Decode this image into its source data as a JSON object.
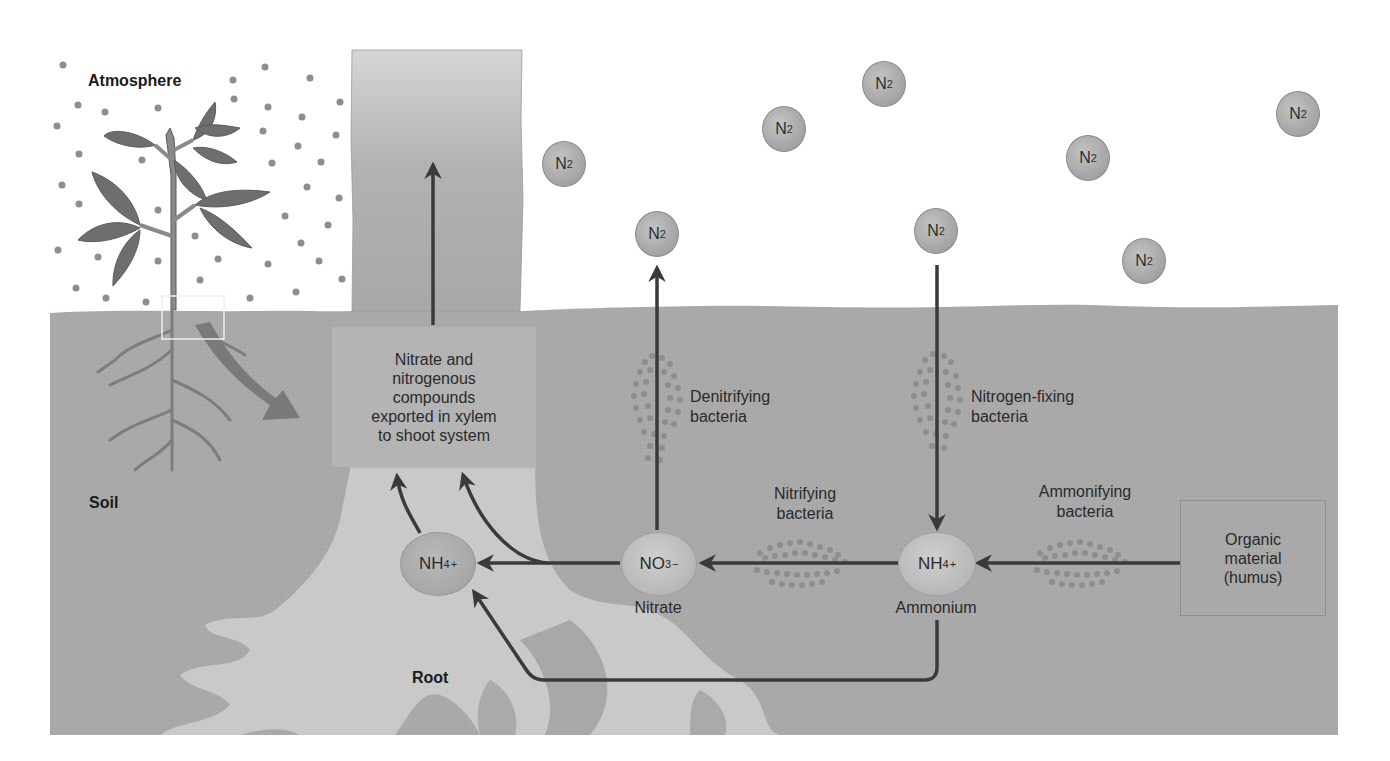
{
  "figure": {
    "colors": {
      "background": "#ffffff",
      "soil": "#a9a9a9",
      "root": "#c9c9c9",
      "stem": "#b0b0b0",
      "arrow": "#3a3a3a",
      "molecule": "#aaaaaa",
      "bacteria_dot": "#8c8c8c"
    }
  },
  "regions": {
    "atmosphere": "Atmosphere",
    "soil": "Soil",
    "root": "Root"
  },
  "atmosphere_molecules": [
    {
      "label": "N",
      "sub": "2",
      "x": 542,
      "y": 141
    },
    {
      "label": "N",
      "sub": "2",
      "x": 762,
      "y": 106
    },
    {
      "label": "N",
      "sub": "2",
      "x": 862,
      "y": 61
    },
    {
      "label": "N",
      "sub": "2",
      "x": 1066,
      "y": 135
    },
    {
      "label": "N",
      "sub": "2",
      "x": 1276,
      "y": 91
    },
    {
      "label": "N",
      "sub": "2",
      "x": 635,
      "y": 211
    },
    {
      "label": "N",
      "sub": "2",
      "x": 914,
      "y": 208
    },
    {
      "label": "N",
      "sub": "2",
      "x": 1122,
      "y": 238
    }
  ],
  "xylem_box": {
    "lines": [
      "Nitrate and",
      "nitrogenous",
      "compounds",
      "exported in xylem",
      "to shoot system"
    ]
  },
  "ions": {
    "root_ammonium": {
      "base": "NH",
      "sub": "4",
      "sup": "+"
    },
    "nitrate": {
      "base": "NO",
      "sub": "3",
      "sup": "−",
      "caption": "Nitrate"
    },
    "soil_ammonium": {
      "base": "NH",
      "sub": "4",
      "sup": "+",
      "caption": "Ammonium"
    }
  },
  "bacteria": {
    "denitrifying": [
      "Denitrifying",
      "bacteria"
    ],
    "nitrogen_fixing": [
      "Nitrogen-fixing",
      "bacteria"
    ],
    "nitrifying": [
      "Nitrifying",
      "bacteria"
    ],
    "ammonifying": [
      "Ammonifying",
      "bacteria"
    ]
  },
  "humus_box": {
    "lines": [
      "Organic",
      "material",
      "(humus)"
    ]
  }
}
